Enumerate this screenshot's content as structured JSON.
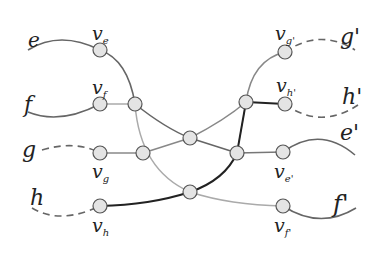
{
  "diagram": {
    "type": "graph-gadget",
    "colors": {
      "edge_dark": "#222222",
      "edge_mid": "#666666",
      "edge_light": "#aaaaaa",
      "node_fill": "#e4e4e4",
      "node_stroke": "#555555"
    },
    "terminals_left": [
      {
        "id": "e",
        "label": "e",
        "style": "solid"
      },
      {
        "id": "f",
        "label": "f",
        "style": "solid"
      },
      {
        "id": "g",
        "label": "g",
        "style": "dashed"
      },
      {
        "id": "h",
        "label": "h",
        "style": "dashed"
      }
    ],
    "terminals_right": [
      {
        "id": "g'",
        "label": "g'",
        "style": "dashed"
      },
      {
        "id": "h'",
        "label": "h'",
        "style": "dashed"
      },
      {
        "id": "e'",
        "label": "e'",
        "style": "solid"
      },
      {
        "id": "f'",
        "label": "f'",
        "style": "solid"
      }
    ],
    "vertex_labels": {
      "ve": {
        "base": "v",
        "sub": "e"
      },
      "vf": {
        "base": "v",
        "sub": "f"
      },
      "vg": {
        "base": "v",
        "sub": "g"
      },
      "vh": {
        "base": "v",
        "sub": "h"
      },
      "vg2": {
        "base": "v",
        "sub": "g'"
      },
      "vh2": {
        "base": "v",
        "sub": "h'"
      },
      "ve2": {
        "base": "v",
        "sub": "e'"
      },
      "vf2": {
        "base": "v",
        "sub": "f'"
      }
    }
  }
}
